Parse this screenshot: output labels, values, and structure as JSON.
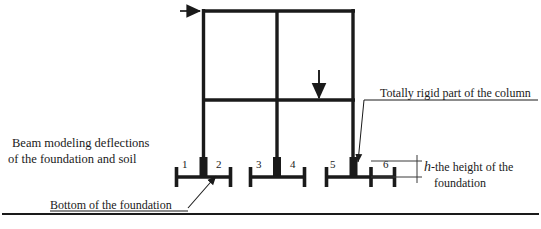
{
  "figure": {
    "type": "structural-frame-diagram"
  },
  "labels": {
    "beam_modeling_line1": "Beam modeling deflections",
    "beam_modeling_line2": "of  the foundation and soil",
    "totally_rigid": "Totally rigid part of the column",
    "bottom_of_foundation": "Bottom of the foundation",
    "height_symbol": "h",
    "height_text_line1": "-the height of the",
    "height_text_line2": "foundation"
  },
  "nodes": [
    {
      "id": "1",
      "x": 182,
      "y": 158
    },
    {
      "id": "2",
      "x": 216,
      "y": 158
    },
    {
      "id": "3",
      "x": 256,
      "y": 158
    },
    {
      "id": "4",
      "x": 290,
      "y": 158
    },
    {
      "id": "5",
      "x": 330,
      "y": 158
    },
    {
      "id": "6",
      "x": 383,
      "y": 158
    }
  ],
  "loads": [
    {
      "name": "horizontal-load-arrow",
      "direction": "right",
      "x": 180,
      "y": 11
    },
    {
      "name": "vertical-load-arrow",
      "direction": "down",
      "x": 319,
      "y": 70
    }
  ],
  "geometry": {
    "frame_left_x": 203,
    "frame_mid_x": 277,
    "frame_right_x": 354,
    "top_beam_y": 11,
    "mid_beam_y": 100,
    "column_base_y": 170,
    "ground_line_y": 214
  },
  "colors": {
    "line": "#1a1a1a",
    "background": "#ffffff",
    "thin_line": "#3a3a3a"
  }
}
